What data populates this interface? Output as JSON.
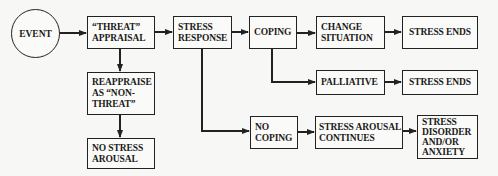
{
  "diagram": {
    "type": "flowchart",
    "title": "",
    "colors": {
      "line": "#222222",
      "background": "#f7f7f5",
      "box_fill": "#fafaf8",
      "text": "#1a1a1a"
    },
    "nodes": {
      "event": {
        "lines": [
          "EVENT"
        ]
      },
      "threat_appraisal": {
        "lines": [
          "“THREAT”",
          "APPRAISAL"
        ]
      },
      "stress_response": {
        "lines": [
          "STRESS",
          "RESPONSE"
        ]
      },
      "coping": {
        "lines": [
          "COPING"
        ]
      },
      "change_situation": {
        "lines": [
          "CHANGE",
          "SITUATION"
        ]
      },
      "stress_ends_1": {
        "lines": [
          "STRESS ENDS"
        ]
      },
      "palliative": {
        "lines": [
          "PALLIATIVE"
        ]
      },
      "stress_ends_2": {
        "lines": [
          "STRESS ENDS"
        ]
      },
      "reappraise": {
        "lines": [
          "REAPPRAISE",
          "AS “NON-",
          "THREAT”"
        ]
      },
      "no_stress_arousal": {
        "lines": [
          "NO STRESS",
          "AROUSAL"
        ]
      },
      "no_coping": {
        "lines": [
          "NO",
          "COPING"
        ]
      },
      "stress_arousal_continues": {
        "lines": [
          "STRESS AROUSAL",
          "CONTINUES"
        ]
      },
      "stress_disorder": {
        "lines": [
          "STRESS",
          "DISORDER",
          "AND/OR",
          "ANXIETY"
        ]
      }
    },
    "edges": [
      [
        "event",
        "threat_appraisal"
      ],
      [
        "threat_appraisal",
        "stress_response"
      ],
      [
        "threat_appraisal",
        "reappraise"
      ],
      [
        "reappraise",
        "no_stress_arousal"
      ],
      [
        "stress_response",
        "coping"
      ],
      [
        "stress_response",
        "no_coping"
      ],
      [
        "coping",
        "change_situation"
      ],
      [
        "coping",
        "palliative"
      ],
      [
        "change_situation",
        "stress_ends_1"
      ],
      [
        "palliative",
        "stress_ends_2"
      ],
      [
        "no_coping",
        "stress_arousal_continues"
      ],
      [
        "stress_arousal_continues",
        "stress_disorder"
      ]
    ]
  }
}
